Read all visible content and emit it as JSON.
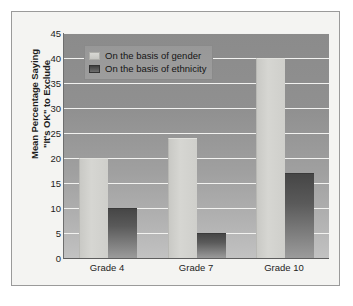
{
  "chart_data": {
    "type": "bar",
    "title": "",
    "xlabel": "",
    "ylabel": "Mean Percentage Saying \"It's OK\" to Exclude",
    "ylabel_line1": "Mean Percentage Saying",
    "ylabel_line2": "\"It's OK\" to Exclude",
    "categories": [
      "Grade 4",
      "Grade 7",
      "Grade 10"
    ],
    "series": [
      {
        "name": "On the basis of gender",
        "values": [
          20,
          24,
          40
        ],
        "color": "#d3d3cf"
      },
      {
        "name": "On the basis of ethnicity",
        "values": [
          10,
          5,
          17
        ],
        "color": "#4d4d4d"
      }
    ],
    "ylim": [
      0,
      45
    ],
    "ytick_values": [
      0,
      5,
      10,
      15,
      20,
      25,
      30,
      35,
      40,
      45
    ],
    "ytick_labels": [
      "0",
      "5",
      "10",
      "15",
      "20",
      "25",
      "30",
      "35",
      "40",
      "45"
    ],
    "grid": true,
    "grid_axis": "y",
    "grid_color": "#f2f2f0",
    "legend_position": "top-left",
    "plot_background": "gray gradient",
    "figure_background": "#f4f4f2"
  }
}
